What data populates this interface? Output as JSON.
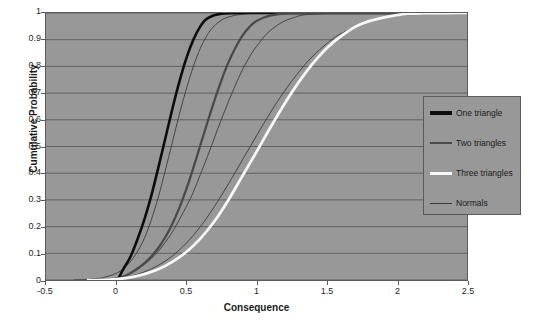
{
  "chart_data": {
    "type": "line",
    "title": "",
    "xlabel": "Consequence",
    "ylabel": "Cumulative Probability",
    "xlim": [
      -0.5,
      2.5
    ],
    "ylim": [
      0,
      1
    ],
    "xticks": [
      "-0.5",
      "0",
      "0.5",
      "1",
      "1.5",
      "2",
      "2.5"
    ],
    "xtick_values": [
      -0.5,
      0,
      0.5,
      1,
      1.5,
      2,
      2.5
    ],
    "yticks": [
      "0",
      "0.1",
      "0.2",
      "0.3",
      "0.4",
      "0.5",
      "0.6",
      "0.7",
      "0.8",
      "0.9",
      "1"
    ],
    "ytick_values": [
      0,
      0.1,
      0.2,
      0.3,
      0.4,
      0.5,
      0.6,
      0.7,
      0.8,
      0.9,
      1
    ],
    "grid": "horizontal",
    "legend_position": "right",
    "plot_background": "#989898",
    "gridline_color": "#5a5a5a",
    "series": [
      {
        "name": "One triangle",
        "color": "#0d0d0d",
        "width": 2.6,
        "x": [
          -0.2,
          -0.1,
          0.0,
          0.02,
          0.05,
          0.1,
          0.15,
          0.2,
          0.25,
          0.3,
          0.35,
          0.4,
          0.45,
          0.5,
          0.55,
          0.6,
          0.65,
          0.75,
          1.0,
          1.5,
          2.0,
          2.5
        ],
        "y": [
          0.0,
          0.0,
          0.0,
          0.01,
          0.04,
          0.085,
          0.15,
          0.225,
          0.315,
          0.42,
          0.53,
          0.64,
          0.742,
          0.83,
          0.9,
          0.95,
          0.98,
          0.997,
          1.0,
          1.0,
          1.0,
          1.0
        ]
      },
      {
        "name": "Two triangles",
        "color": "#4a4a4a",
        "width": 2.3,
        "x": [
          -0.2,
          -0.1,
          0.0,
          0.05,
          0.1,
          0.15,
          0.2,
          0.25,
          0.3,
          0.35,
          0.4,
          0.45,
          0.5,
          0.55,
          0.6,
          0.65,
          0.7,
          0.75,
          0.8,
          0.85,
          0.9,
          0.95,
          1.0,
          1.1,
          1.25,
          1.5,
          2.0,
          2.5
        ],
        "y": [
          0.0,
          0.0,
          0.004,
          0.012,
          0.025,
          0.042,
          0.062,
          0.088,
          0.12,
          0.16,
          0.21,
          0.27,
          0.34,
          0.42,
          0.505,
          0.59,
          0.672,
          0.748,
          0.815,
          0.87,
          0.915,
          0.948,
          0.97,
          0.991,
          0.999,
          1.0,
          1.0,
          1.0
        ]
      },
      {
        "name": "Three triangles",
        "color": "#f7f7f7",
        "width": 2.8,
        "x": [
          -0.2,
          -0.1,
          0.0,
          0.1,
          0.2,
          0.3,
          0.4,
          0.5,
          0.6,
          0.7,
          0.8,
          0.9,
          1.0,
          1.1,
          1.2,
          1.3,
          1.4,
          1.5,
          1.6,
          1.75,
          2.0,
          2.25,
          2.5
        ],
        "y": [
          0.0,
          0.0,
          0.003,
          0.01,
          0.022,
          0.04,
          0.068,
          0.105,
          0.155,
          0.22,
          0.3,
          0.39,
          0.48,
          0.572,
          0.66,
          0.74,
          0.81,
          0.868,
          0.912,
          0.96,
          0.992,
          0.999,
          1.0
        ]
      },
      {
        "name": "Normals",
        "color": "#3a3a3a",
        "width": 0.9,
        "curves": [
          {
            "x": [
              -0.3,
              -0.2,
              -0.1,
              0.0,
              0.05,
              0.1,
              0.15,
              0.2,
              0.25,
              0.3,
              0.35,
              0.4,
              0.45,
              0.5,
              0.55,
              0.6,
              0.65,
              0.7,
              0.8,
              1.0,
              1.5,
              2.5
            ],
            "y": [
              0.0,
              0.002,
              0.008,
              0.025,
              0.042,
              0.068,
              0.105,
              0.155,
              0.225,
              0.31,
              0.41,
              0.515,
              0.62,
              0.715,
              0.8,
              0.868,
              0.918,
              0.952,
              0.985,
              0.999,
              1.0,
              1.0
            ]
          },
          {
            "x": [
              -0.2,
              -0.1,
              0.0,
              0.1,
              0.2,
              0.3,
              0.4,
              0.5,
              0.55,
              0.6,
              0.65,
              0.7,
              0.75,
              0.8,
              0.85,
              0.9,
              0.95,
              1.0,
              1.1,
              1.25,
              1.5,
              2.5
            ],
            "y": [
              0.0,
              0.002,
              0.008,
              0.025,
              0.058,
              0.108,
              0.18,
              0.275,
              0.33,
              0.395,
              0.462,
              0.532,
              0.602,
              0.668,
              0.73,
              0.788,
              0.835,
              0.875,
              0.935,
              0.98,
              0.998,
              1.0
            ]
          },
          {
            "x": [
              -0.2,
              -0.1,
              0.0,
              0.1,
              0.2,
              0.3,
              0.4,
              0.5,
              0.6,
              0.7,
              0.8,
              0.9,
              1.0,
              1.1,
              1.2,
              1.3,
              1.4,
              1.5,
              1.6,
              1.8,
              2.0,
              2.5
            ],
            "y": [
              0.0,
              0.001,
              0.005,
              0.014,
              0.03,
              0.055,
              0.09,
              0.138,
              0.2,
              0.275,
              0.36,
              0.45,
              0.54,
              0.628,
              0.708,
              0.778,
              0.838,
              0.885,
              0.922,
              0.968,
              0.99,
              1.0
            ]
          }
        ]
      }
    ],
    "legend": [
      {
        "label": "One triangle",
        "color": "#0d0d0d",
        "width": 3.2
      },
      {
        "label": "Two triangles",
        "color": "#4a4a4a",
        "width": 2.4
      },
      {
        "label": "Three triangles",
        "color": "#f7f7f7",
        "width": 3.0
      },
      {
        "label": "Normals",
        "color": "#3a3a3a",
        "width": 1.0
      }
    ]
  }
}
